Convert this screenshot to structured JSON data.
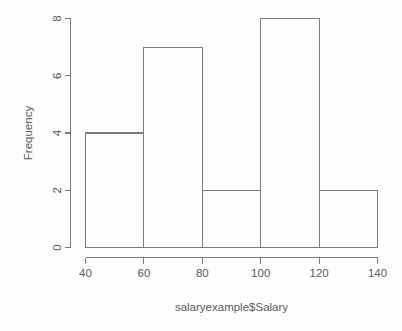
{
  "chart_data": {
    "type": "bar",
    "title": "",
    "subtitle": "",
    "xlabel": "salaryexample$Salary",
    "ylabel": "Frequency",
    "categories": [
      "40-60",
      "60-80",
      "80-100",
      "100-120",
      "120-140"
    ],
    "bin_edges": [
      40,
      60,
      80,
      100,
      120,
      140
    ],
    "values": [
      4,
      7,
      2,
      8,
      2
    ],
    "x": [
      50,
      70,
      90,
      110,
      130
    ],
    "xlim": [
      40,
      140
    ],
    "ylim": [
      0,
      8
    ],
    "xticks": [
      "40",
      "60",
      "80",
      "100",
      "120",
      "140"
    ],
    "xtick_values": [
      40,
      60,
      80,
      100,
      120,
      140
    ],
    "yticks": [
      "0",
      "2",
      "4",
      "6",
      "8"
    ],
    "ytick_values": [
      0,
      2,
      4,
      6,
      8
    ],
    "grid": false,
    "legend": null,
    "legend_position": "none",
    "bar_fill": "none",
    "bar_stroke": "#7a7a7a",
    "background": "#fdfdfd",
    "axis_color": "#7a7a7a",
    "text_color": "#5a5a5a"
  },
  "axes": {
    "x_title": "salaryexample$Salary",
    "y_title": "Frequency"
  },
  "xtick_labels": {
    "t0": "40",
    "t1": "60",
    "t2": "80",
    "t3": "100",
    "t4": "120",
    "t5": "140"
  },
  "ytick_labels": {
    "t0": "0",
    "t1": "2",
    "t2": "4",
    "t3": "6",
    "t4": "8"
  }
}
